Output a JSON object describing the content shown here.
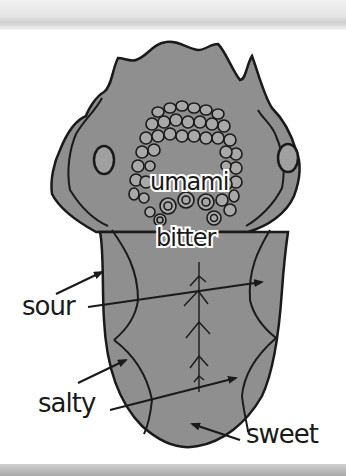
{
  "diagram": {
    "colors": {
      "tongue_fill": "#8f8f8f",
      "tongue_outline": "#1a1a1a",
      "papillae_fill": "#a8a8a8",
      "background": "#ffffff",
      "label_text": "#1a1a1a"
    },
    "labels": {
      "umami": "umami",
      "bitter": "bitter",
      "sour": "sour",
      "salty": "salty",
      "sweet": "sweet"
    }
  }
}
